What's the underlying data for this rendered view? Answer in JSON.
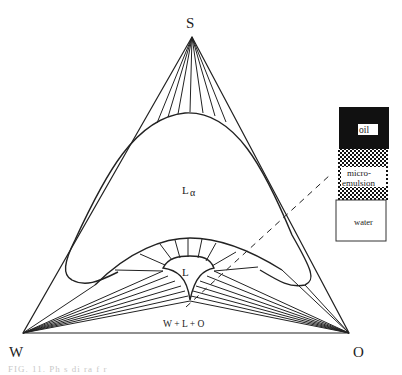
{
  "diagram": {
    "type": "ternary-phase-diagram",
    "vertices": {
      "top": "S",
      "left": "W",
      "right": "O"
    },
    "regions": {
      "lamellar": "L",
      "lamellar_subscript": "α",
      "microemulsion": "L",
      "three_phase": "W + L + O"
    },
    "legend": {
      "layers": [
        {
          "label": "oil",
          "fill": "#111111"
        },
        {
          "label_line1": "micro-",
          "label_line2": "emulsion",
          "fill": "checkered"
        },
        {
          "label": "water",
          "fill": "#ffffff"
        }
      ]
    },
    "caption": "FIG. 11. Ph  s  di  ra   f   r   "
  }
}
